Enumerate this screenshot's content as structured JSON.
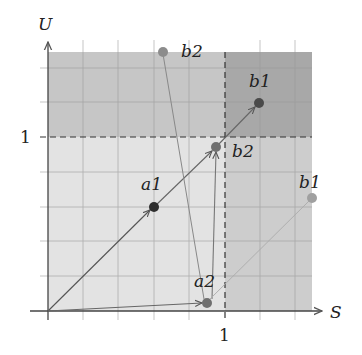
{
  "diagram": {
    "axes": {
      "x_label": "S",
      "y_label": "U",
      "x_tick_label": "1",
      "y_tick_label": "1"
    },
    "regions": {
      "base": "#e3e3e3",
      "top_band": "#c6c6c6",
      "right_band": "#cdcdcd",
      "top_right": "#a8a8a8"
    },
    "points": [
      {
        "id": "a1",
        "label": "a1",
        "color": "#2e2e2e"
      },
      {
        "id": "b2_mid",
        "label": "b2",
        "color": "#707070"
      },
      {
        "id": "b1_dark",
        "label": "b1",
        "color": "#4a4a4a"
      },
      {
        "id": "b2_top",
        "label": "b2",
        "color": "#8c8c8c"
      },
      {
        "id": "a2",
        "label": "a2",
        "color": "#707070"
      },
      {
        "id": "b1_right",
        "label": "b1",
        "color": "#a0a0a0"
      }
    ]
  }
}
